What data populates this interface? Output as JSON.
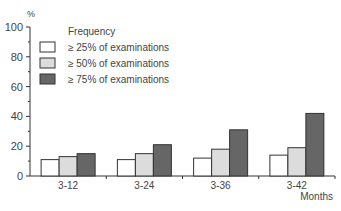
{
  "chart_data": {
    "type": "bar",
    "title": "",
    "ylabel": "%",
    "xlabel": "Months",
    "ylim": [
      0,
      100
    ],
    "yticks": [
      0,
      20,
      40,
      60,
      80,
      100
    ],
    "categories": [
      "3-12",
      "3-24",
      "3-36",
      "3-42"
    ],
    "legend_title": "Frequency",
    "legend_position": "top-left",
    "series": [
      {
        "name": "≥ 25% of examinations",
        "color": "#ffffff",
        "values": [
          11,
          11,
          12,
          14
        ]
      },
      {
        "name": "≥ 50% of examinations",
        "color": "#dcdcdc",
        "values": [
          13,
          15,
          18,
          19
        ]
      },
      {
        "name": "≥ 75% of examinations",
        "color": "#666666",
        "values": [
          15,
          21,
          31,
          42
        ]
      }
    ]
  }
}
